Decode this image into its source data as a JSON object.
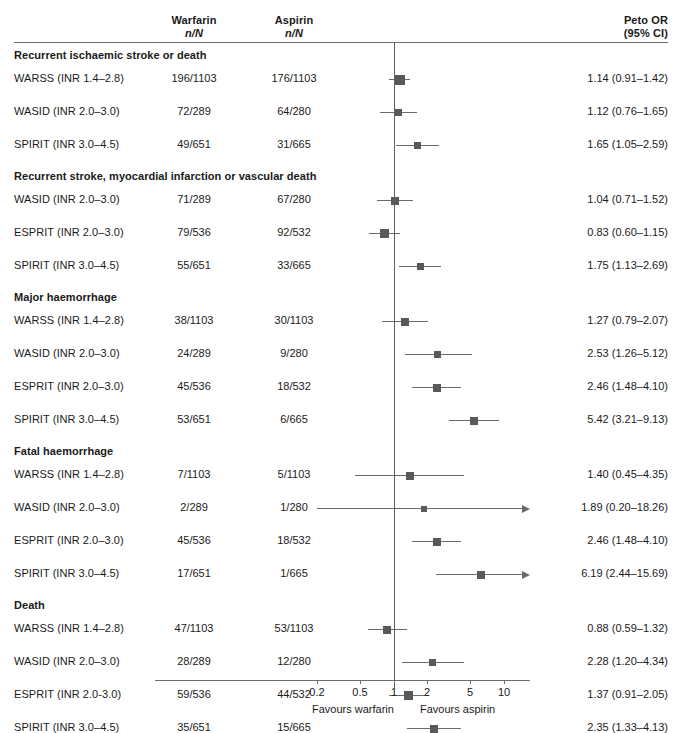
{
  "figure": {
    "type": "forest-plot",
    "headers": {
      "warfarin": "Warfarin",
      "warfarin_sub": "n/N",
      "aspirin": "Aspirin",
      "aspirin_sub": "n/N",
      "effect": "Peto OR",
      "effect_sub": "(95% CI)"
    },
    "axis": {
      "null_value": 1,
      "ticks": [
        {
          "label": "0.2",
          "value": 0.2
        },
        {
          "label": "0.5",
          "value": 0.5
        },
        {
          "label": "1",
          "value": 1
        },
        {
          "label": "2",
          "value": 2
        },
        {
          "label": "5",
          "value": 5
        },
        {
          "label": "10",
          "value": 10
        }
      ],
      "left_caption": "Favours warfarin",
      "right_caption": "Favours aspirin",
      "scale": "log10",
      "px_per_decade": 110,
      "x_at_one": 393.5
    },
    "colors": {
      "marker": "#595959",
      "line": "#6a6a6a",
      "rule": "#6d6d6d",
      "text": "#1a1a1a",
      "background": "#ffffff"
    }
  },
  "chart_data": {
    "type": "forest",
    "title": "",
    "xlabel": "Peto OR (95% CI)",
    "ylabel": "",
    "xscale": "log",
    "xlim": [
      0.15,
      20
    ],
    "null_line": 1,
    "groups": [
      {
        "label": "Recurrent ischaemic stroke or death",
        "rows": [
          {
            "study": "WARSS (INR 1.4–2.8)",
            "warfarin": "196/1103",
            "aspirin": "176/1103",
            "or": 1.14,
            "lo": 0.91,
            "hi": 1.42,
            "effect_text": "1.14 (0.91–1.42)",
            "weight": 10,
            "truncated_right": false
          },
          {
            "study": "WASID (INR 2.0–3.0)",
            "warfarin": "72/289",
            "aspirin": "64/280",
            "or": 1.12,
            "lo": 0.76,
            "hi": 1.65,
            "effect_text": "1.12 (0.76–1.65)",
            "weight": 7,
            "truncated_right": false
          },
          {
            "study": "SPIRIT (INR 3.0–4.5)",
            "warfarin": "49/651",
            "aspirin": "31/665",
            "or": 1.65,
            "lo": 1.05,
            "hi": 2.59,
            "effect_text": "1.65 (1.05–2.59)",
            "weight": 7,
            "truncated_right": false
          }
        ]
      },
      {
        "label": "Recurrent stroke, myocardial infarction or vascular death",
        "rows": [
          {
            "study": "WASID (INR 2.0–3.0)",
            "warfarin": "71/289",
            "aspirin": "67/280",
            "or": 1.04,
            "lo": 0.71,
            "hi": 1.52,
            "effect_text": "1.04 (0.71–1.52)",
            "weight": 8,
            "truncated_right": false
          },
          {
            "study": "ESPRIT (INR 2.0–3.0)",
            "warfarin": "79/536",
            "aspirin": "92/532",
            "or": 0.83,
            "lo": 0.6,
            "hi": 1.15,
            "effect_text": "0.83 (0.60–1.15)",
            "weight": 9,
            "truncated_right": false
          },
          {
            "study": "SPIRIT (INR 3.0–4.5)",
            "warfarin": "55/651",
            "aspirin": "33/665",
            "or": 1.75,
            "lo": 1.13,
            "hi": 2.69,
            "effect_text": "1.75 (1.13–2.69)",
            "weight": 7,
            "truncated_right": false
          }
        ]
      },
      {
        "label": "Major haemorrhage",
        "rows": [
          {
            "study": "WARSS (INR 1.4–2.8)",
            "warfarin": "38/1103",
            "aspirin": "30/1103",
            "or": 1.27,
            "lo": 0.79,
            "hi": 2.07,
            "effect_text": "1.27 (0.79–2.07)",
            "weight": 8,
            "truncated_right": false
          },
          {
            "study": "WASID (INR 2.0–3.0)",
            "warfarin": "24/289",
            "aspirin": "9/280",
            "or": 2.53,
            "lo": 1.26,
            "hi": 5.12,
            "effect_text": "2.53 (1.26–5.12)",
            "weight": 7,
            "truncated_right": false
          },
          {
            "study": "ESPRIT (INR 2.0–3.0)",
            "warfarin": "45/536",
            "aspirin": "18/532",
            "or": 2.46,
            "lo": 1.48,
            "hi": 4.1,
            "effect_text": "2.46 (1.48–4.10)",
            "weight": 8,
            "truncated_right": false
          },
          {
            "study": "SPIRIT (INR 3.0–4.5)",
            "warfarin": "53/651",
            "aspirin": "6/665",
            "or": 5.42,
            "lo": 3.21,
            "hi": 9.13,
            "effect_text": "5.42 (3.21–9.13)",
            "weight": 8,
            "truncated_right": false
          }
        ]
      },
      {
        "label": "Fatal haemorrhage",
        "rows": [
          {
            "study": "WARSS (INR 1.4–2.8)",
            "warfarin": "7/1103",
            "aspirin": "5/1103",
            "or": 1.4,
            "lo": 0.45,
            "hi": 4.35,
            "effect_text": "1.40 (0.45–4.35)",
            "weight": 8,
            "truncated_right": false
          },
          {
            "study": "WASID (INR 2.0–3.0)",
            "warfarin": "2/289",
            "aspirin": "1/280",
            "or": 1.89,
            "lo": 0.2,
            "hi": 18.26,
            "effect_text": "1.89 (0.20–18.26)",
            "weight": 6,
            "truncated_right": true
          },
          {
            "study": "ESPRIT (INR 2.0–3.0)",
            "warfarin": "45/536",
            "aspirin": "18/532",
            "or": 2.46,
            "lo": 1.48,
            "hi": 4.1,
            "effect_text": "2.46 (1.48–4.10)",
            "weight": 8,
            "truncated_right": false
          },
          {
            "study": "SPIRIT (INR 3.0–4.5)",
            "warfarin": "17/651",
            "aspirin": "1/665",
            "or": 6.19,
            "lo": 2.44,
            "hi": 15.69,
            "effect_text": "6.19 (2.44–15.69)",
            "weight": 8,
            "truncated_right": true
          }
        ]
      },
      {
        "label": "Death",
        "rows": [
          {
            "study": "WARSS (INR 1.4–2.8)",
            "warfarin": "47/1103",
            "aspirin": "53/1103",
            "or": 0.88,
            "lo": 0.59,
            "hi": 1.32,
            "effect_text": "0.88 (0.59–1.32)",
            "weight": 8,
            "truncated_right": false
          },
          {
            "study": "WASID (INR 2.0–3.0)",
            "warfarin": "28/289",
            "aspirin": "12/280",
            "or": 2.28,
            "lo": 1.2,
            "hi": 4.34,
            "effect_text": "2.28 (1.20–4.34)",
            "weight": 7,
            "truncated_right": false
          },
          {
            "study": "ESPRIT (INR 2.0-3.0)",
            "warfarin": "59/536",
            "aspirin": "44/532",
            "or": 1.37,
            "lo": 0.91,
            "hi": 2.05,
            "effect_text": "1.37 (0.91–2.05)",
            "weight": 9,
            "truncated_right": false
          },
          {
            "study": "SPIRIT (INR 3.0–4.5)",
            "warfarin": "35/651",
            "aspirin": "15/665",
            "or": 2.35,
            "lo": 1.33,
            "hi": 4.13,
            "effect_text": "2.35 (1.33–4.13)",
            "weight": 8,
            "truncated_right": false
          }
        ]
      }
    ]
  }
}
